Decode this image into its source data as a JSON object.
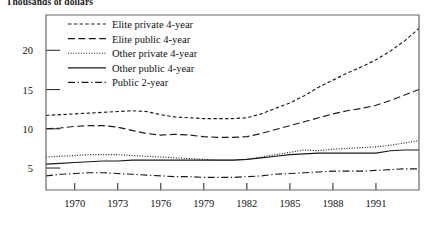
{
  "axis_title": "Thousands of dollars",
  "chart_data": {
    "type": "line",
    "title": "",
    "subtitle": "",
    "xlabel": "",
    "ylabel": "Thousands of dollars",
    "xlim": [
      1968,
      1994
    ],
    "ylim": [
      2.2,
      24.5
    ],
    "grid": false,
    "legend_position": "top-center-inside",
    "xticks": [
      1970,
      1973,
      1976,
      1979,
      1982,
      1985,
      1988,
      1991
    ],
    "xtick_labels": [
      "1970",
      "1973",
      "1976",
      "1979",
      "1982",
      "1985",
      "1988",
      "1991"
    ],
    "yticks": [
      5,
      10,
      15,
      20
    ],
    "ytick_labels": [
      "5",
      "10",
      "15",
      "20"
    ],
    "x": [
      1968,
      1969,
      1970,
      1971,
      1972,
      1973,
      1974,
      1975,
      1976,
      1977,
      1978,
      1979,
      1980,
      1981,
      1982,
      1983,
      1984,
      1985,
      1986,
      1987,
      1988,
      1989,
      1990,
      1991,
      1992,
      1993,
      1994
    ],
    "series": [
      {
        "name": "Elite private 4-year",
        "dash": "dashed-short",
        "values": [
          11.7,
          11.8,
          11.9,
          12.0,
          12.1,
          12.2,
          12.3,
          12.2,
          11.8,
          11.5,
          11.4,
          11.3,
          11.3,
          11.3,
          11.4,
          11.9,
          12.6,
          13.3,
          14.2,
          15.3,
          16.2,
          17.1,
          17.9,
          18.8,
          19.9,
          21.2,
          22.8
        ]
      },
      {
        "name": "Elite public 4-year",
        "dash": "dashed-long",
        "values": [
          10.0,
          10.1,
          10.3,
          10.4,
          10.4,
          10.2,
          9.8,
          9.4,
          9.2,
          9.3,
          9.2,
          9.0,
          8.9,
          8.9,
          9.0,
          9.4,
          9.9,
          10.4,
          10.9,
          11.4,
          11.9,
          12.3,
          12.6,
          13.0,
          13.6,
          14.3,
          15.0
        ]
      },
      {
        "name": "Other private 4-year",
        "dash": "dotted",
        "values": [
          6.4,
          6.5,
          6.6,
          6.7,
          6.7,
          6.7,
          6.6,
          6.5,
          6.4,
          6.3,
          6.2,
          6.1,
          6.0,
          6.0,
          6.1,
          6.4,
          6.7,
          7.0,
          7.3,
          7.2,
          7.4,
          7.5,
          7.6,
          7.7,
          7.9,
          8.2,
          8.5
        ]
      },
      {
        "name": "Other public 4-year",
        "dash": "solid",
        "values": [
          5.5,
          5.6,
          5.7,
          5.8,
          5.9,
          5.9,
          6.0,
          6.0,
          6.0,
          6.0,
          6.0,
          6.0,
          6.0,
          6.0,
          6.1,
          6.3,
          6.5,
          6.7,
          6.8,
          6.9,
          6.9,
          6.9,
          6.9,
          6.9,
          7.2,
          7.3,
          7.3
        ]
      },
      {
        "name": "Public 2-year",
        "dash": "dash-dot",
        "values": [
          4.0,
          4.2,
          4.3,
          4.4,
          4.4,
          4.3,
          4.2,
          4.1,
          4.0,
          3.9,
          3.9,
          3.8,
          3.8,
          3.8,
          3.9,
          4.0,
          4.2,
          4.3,
          4.4,
          4.5,
          4.6,
          4.6,
          4.6,
          4.7,
          4.8,
          4.9,
          4.9
        ]
      }
    ]
  },
  "legend": {
    "items": [
      {
        "label": "Elite private 4-year"
      },
      {
        "label": "Elite public 4-year"
      },
      {
        "label": "Other private 4-year"
      },
      {
        "label": "Other public 4-year"
      },
      {
        "label": "Public 2-year"
      }
    ]
  }
}
